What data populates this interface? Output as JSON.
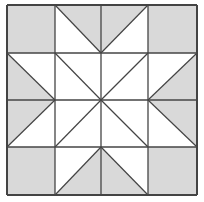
{
  "diagram": {
    "type": "quilt-block",
    "pattern": "eight-pointed star",
    "grid": {
      "rows": 4,
      "cols": 4
    },
    "colors": {
      "shade": "#d9d9d9",
      "background": "#ffffff",
      "line": "#444444"
    },
    "x_lines": [
      7,
      55,
      101,
      148,
      197
    ],
    "y_lines": [
      5,
      53,
      100,
      147,
      195
    ],
    "cells": [
      [
        {
          "fill": "full"
        },
        {
          "diag": "\\",
          "shade": "top-right"
        },
        {
          "diag": "/",
          "shade": "top-left"
        },
        {
          "fill": "full"
        }
      ],
      [
        {
          "diag": "\\",
          "shade": "bottom-left"
        },
        {
          "diag": "\\",
          "shade": "none"
        },
        {
          "diag": "/",
          "shade": "none"
        },
        {
          "diag": "/",
          "shade": "bottom-right"
        }
      ],
      [
        {
          "diag": "/",
          "shade": "top-left"
        },
        {
          "diag": "/",
          "shade": "none"
        },
        {
          "diag": "\\",
          "shade": "none"
        },
        {
          "diag": "\\",
          "shade": "top-right"
        }
      ],
      [
        {
          "fill": "full"
        },
        {
          "diag": "/",
          "shade": "bottom-right"
        },
        {
          "diag": "\\",
          "shade": "bottom-left"
        },
        {
          "fill": "full"
        }
      ]
    ]
  }
}
